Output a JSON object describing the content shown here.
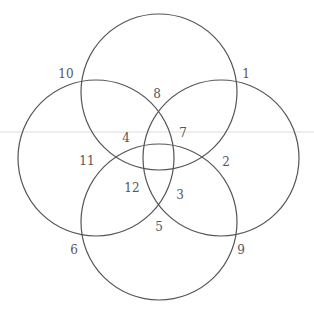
{
  "diagram": {
    "type": "four-circle-venn",
    "stroke_color": "#555555",
    "guide_line_color": "#dddddd",
    "circles": [
      {
        "name": "top",
        "cx": 159,
        "cy": 92,
        "r": 78
      },
      {
        "name": "left",
        "cx": 96,
        "cy": 158,
        "r": 78
      },
      {
        "name": "right",
        "cx": 221,
        "cy": 158,
        "r": 78
      },
      {
        "name": "bottom",
        "cx": 159,
        "cy": 222,
        "r": 78
      }
    ],
    "guide_line": {
      "y": 132
    },
    "labels": [
      {
        "text": "1",
        "x": 246,
        "y": 74
      },
      {
        "text": "2",
        "x": 226,
        "y": 162
      },
      {
        "text": "3",
        "x": 180,
        "y": 195
      },
      {
        "text": "4",
        "x": 126,
        "y": 138
      },
      {
        "text": "5",
        "x": 159,
        "y": 227
      },
      {
        "text": "6",
        "x": 74,
        "y": 250
      },
      {
        "text": "7",
        "x": 183,
        "y": 133
      },
      {
        "text": "8",
        "x": 157,
        "y": 94
      },
      {
        "text": "9",
        "x": 241,
        "y": 250
      },
      {
        "text": "10",
        "x": 66,
        "y": 74
      },
      {
        "text": "11",
        "x": 87,
        "y": 161
      },
      {
        "text": "12",
        "x": 132,
        "y": 188
      }
    ]
  }
}
